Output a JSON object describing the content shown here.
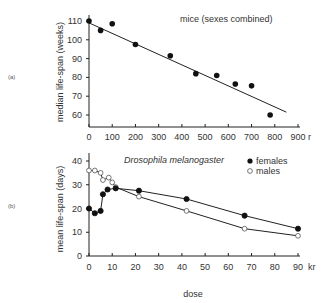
{
  "chart_data": [
    {
      "panel_label": "(a)",
      "type": "scatter",
      "title": "mice (sexes combined)",
      "xlabel": "",
      "x_unit": "r",
      "ylabel": "median life-span (weeks)",
      "xlim": [
        0,
        900
      ],
      "ylim": [
        54,
        112
      ],
      "x_ticks": [
        0,
        100,
        200,
        300,
        400,
        500,
        600,
        700,
        800,
        900
      ],
      "y_ticks": [
        60,
        70,
        80,
        90,
        100,
        110
      ],
      "grid": false,
      "series": [
        {
          "name": "mice",
          "marker": "filled-circle",
          "x": [
            0,
            50,
            100,
            200,
            350,
            460,
            550,
            630,
            700,
            780
          ],
          "y": [
            110,
            105,
            108.5,
            97.5,
            91.5,
            82,
            81,
            76.5,
            75.5,
            60
          ]
        }
      ],
      "fit_line": {
        "x": [
          0,
          850
        ],
        "y": [
          109,
          61.5
        ]
      }
    },
    {
      "panel_label": "(b)",
      "type": "line",
      "title": "Drosophila melanogaster",
      "xlabel": "dose",
      "x_unit": "kr",
      "ylabel": "mean life-span (days)",
      "xlim": [
        0,
        90
      ],
      "ylim": [
        0,
        42
      ],
      "x_ticks": [
        0,
        10,
        20,
        30,
        40,
        50,
        60,
        70,
        80,
        90
      ],
      "y_ticks": [
        0,
        10,
        20,
        30,
        40
      ],
      "grid": false,
      "legend_position": "top-right",
      "series": [
        {
          "name": "females",
          "marker": "filled-circle",
          "x": [
            0,
            2.5,
            5,
            6,
            8,
            11.5,
            21.5,
            42,
            67,
            90
          ],
          "y": [
            20,
            18,
            19,
            26,
            28,
            28.5,
            27.5,
            24,
            17,
            11.5
          ]
        },
        {
          "name": "males",
          "marker": "open-circle",
          "x": [
            0,
            2.5,
            5,
            6,
            8.5,
            10,
            11.5,
            21.5,
            42,
            67,
            90
          ],
          "y": [
            36,
            36,
            35,
            32,
            33,
            31,
            29,
            25,
            19,
            11.5,
            8.5
          ]
        }
      ]
    }
  ],
  "labels": {
    "panel_a": "(a)",
    "panel_b": "(b)",
    "title_a": "mice (sexes combined)",
    "title_b": "Drosophila melanogaster",
    "ylabel_a": "median life-span (weeks)",
    "ylabel_b": "mean life-span (days)",
    "unit_a": "r",
    "unit_b": "kr",
    "xlabel_shared": "dose",
    "legend_females": "females",
    "legend_males": "males"
  }
}
